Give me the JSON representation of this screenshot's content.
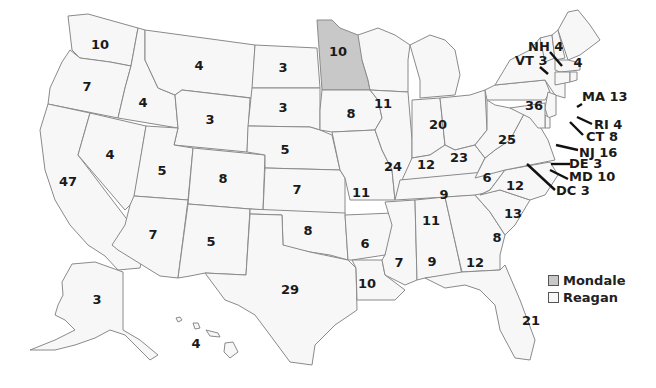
{
  "colors": {
    "mondale": "#c8c8c8",
    "reagan": "#f7f7f7",
    "border": "#8a8a8a"
  },
  "legend": [
    {
      "label": "Mondale",
      "color": "#c8c8c8"
    },
    {
      "label": "Reagan",
      "color": "#f7f7f7"
    }
  ],
  "states": {
    "WA": "10",
    "OR": "7",
    "CA": "47",
    "ID": "4",
    "NV": "4",
    "MT": "4",
    "WY": "3",
    "UT": "5",
    "AZ": "7",
    "CO": "8",
    "NM": "5",
    "ND": "3",
    "SD": "3",
    "NE": "5",
    "KS": "7",
    "OK": "8",
    "TX": "29",
    "MN": "10",
    "IA": "8",
    "MO": "11",
    "AR": "6",
    "LA": "10",
    "WI": "11",
    "IL": "24",
    "MI": "20",
    "IN": "12",
    "OH": "23",
    "KY": "9",
    "TN": "11",
    "MS": "7",
    "AL": "9",
    "GA": "12",
    "FL": "21",
    "SC": "8",
    "NC": "13",
    "VA": "12",
    "WV": "6",
    "PA": "25",
    "NY": "36",
    "ME": "4",
    "AK": "3",
    "HI": "4"
  },
  "callouts": {
    "NH": "NH 4",
    "VT": "VT 3",
    "MA": "MA 13",
    "RI": "RI 4",
    "CT": "CT 8",
    "NJ": "NJ 16",
    "DE": "DE 3",
    "MD": "MD 10",
    "DC": "DC 3"
  }
}
